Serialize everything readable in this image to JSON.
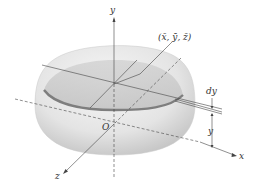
{
  "diagram": {
    "type": "hemisphere-centroid",
    "labels": {
      "y_axis": "y",
      "x_axis": "x",
      "z_axis": "z",
      "origin": "O",
      "centroid": "(x̄, ȳ, z̄)",
      "slice_thickness": "dy",
      "slice_height": "y"
    },
    "colors": {
      "surface_light": "#f2f2f2",
      "surface_mid": "#d6d6d6",
      "slice_band": "#8a8a8a",
      "axis": "#444444",
      "background": "#ffffff"
    }
  }
}
